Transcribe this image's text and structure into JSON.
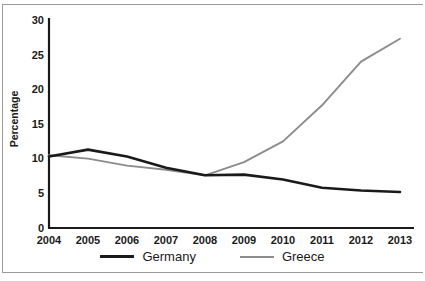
{
  "chart_data": {
    "type": "line",
    "title": "",
    "xlabel": "",
    "ylabel": "Percentage",
    "categories": [
      "2004",
      "2005",
      "2006",
      "2007",
      "2008",
      "2009",
      "2010",
      "2011",
      "2012",
      "2013"
    ],
    "x": [
      2004,
      2005,
      2006,
      2007,
      2008,
      2009,
      2010,
      2011,
      2012,
      2013
    ],
    "series": [
      {
        "name": "Germany",
        "color": "#1a1a1a",
        "values": [
          10.3,
          11.3,
          10.3,
          8.7,
          7.6,
          7.7,
          7.0,
          5.8,
          5.4,
          5.2
        ]
      },
      {
        "name": "Greece",
        "color": "#8c8c8c",
        "values": [
          10.5,
          10.0,
          9.0,
          8.4,
          7.6,
          9.5,
          12.5,
          17.7,
          24.0,
          27.3
        ]
      }
    ],
    "ylim": [
      0,
      30
    ],
    "yticks": [
      0,
      5,
      10,
      15,
      20,
      25,
      30
    ],
    "xticks": [
      "2004",
      "2005",
      "2006",
      "2007",
      "2008",
      "2009",
      "2010",
      "2011",
      "2012",
      "2013"
    ],
    "grid": false,
    "legend_position": "bottom-center"
  },
  "axes": {
    "y_tick_labels": [
      "30",
      "25",
      "20",
      "15",
      "10",
      "5",
      "0"
    ],
    "y_axis_title": "Percentage",
    "x_tick_labels": [
      "2004",
      "2005",
      "2006",
      "2007",
      "2008",
      "2009",
      "2010",
      "2011",
      "2012",
      "2013"
    ]
  },
  "legend": {
    "items": [
      {
        "label": "Germany",
        "color": "#1a1a1a"
      },
      {
        "label": "Greece",
        "color": "#8c8c8c"
      }
    ]
  },
  "colors": {
    "germany": "#1a1a1a",
    "greece": "#8c8c8c",
    "axis": "#1a1a1a",
    "frame": "#9a9a9a",
    "background": "#ffffff"
  }
}
